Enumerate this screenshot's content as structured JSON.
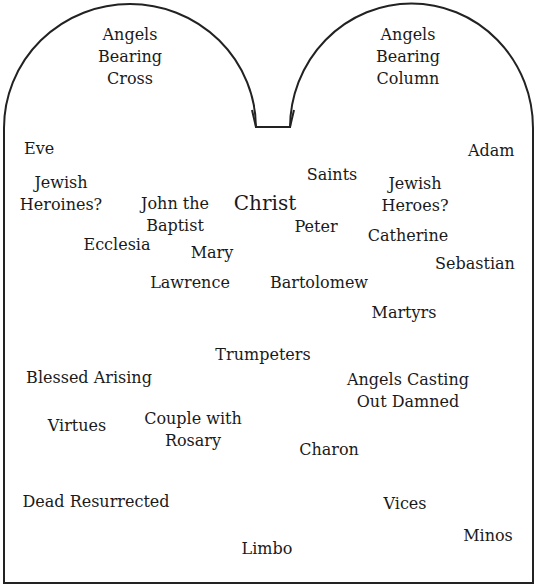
{
  "diagram": {
    "type": "tablet-layout",
    "outline_color": "#222222",
    "text_color": "#1a1a1a",
    "arches": [
      {
        "id": "left-arch",
        "label": "Angels\nBearing\nCross"
      },
      {
        "id": "right-arch",
        "label": "Angels\nBearing\nColumn"
      }
    ],
    "labels": [
      {
        "id": "eve",
        "text": "Eve"
      },
      {
        "id": "adam",
        "text": "Adam"
      },
      {
        "id": "jewish-heroines",
        "text": "Jewish\nHeroines?"
      },
      {
        "id": "john-the-baptist",
        "text": "John the\nBaptist"
      },
      {
        "id": "christ",
        "text": "Christ"
      },
      {
        "id": "saints",
        "text": "Saints"
      },
      {
        "id": "jewish-heroes",
        "text": "Jewish\nHeroes?"
      },
      {
        "id": "peter",
        "text": "Peter"
      },
      {
        "id": "ecclesia",
        "text": "Ecclesia"
      },
      {
        "id": "mary",
        "text": "Mary"
      },
      {
        "id": "catherine",
        "text": "Catherine"
      },
      {
        "id": "sebastian",
        "text": "Sebastian"
      },
      {
        "id": "lawrence",
        "text": "Lawrence"
      },
      {
        "id": "bartolomew",
        "text": "Bartolomew"
      },
      {
        "id": "martyrs",
        "text": "Martyrs"
      },
      {
        "id": "trumpeters",
        "text": "Trumpeters"
      },
      {
        "id": "blessed-arising",
        "text": "Blessed Arising"
      },
      {
        "id": "angels-casting-out-damned",
        "text": "Angels Casting\nOut Damned"
      },
      {
        "id": "virtues",
        "text": "Virtues"
      },
      {
        "id": "couple-with-rosary",
        "text": "Couple with\nRosary"
      },
      {
        "id": "charon",
        "text": "Charon"
      },
      {
        "id": "dead-resurrected",
        "text": "Dead Resurrected"
      },
      {
        "id": "vices",
        "text": "Vices"
      },
      {
        "id": "minos",
        "text": "Minos"
      },
      {
        "id": "limbo",
        "text": "Limbo"
      }
    ]
  }
}
